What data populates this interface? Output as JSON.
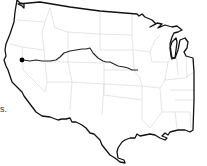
{
  "map": {
    "region": "Contiguous United States (western and central portion)",
    "colors": {
      "background": "#ffffff",
      "coastline": "#111111",
      "state_borders": "#d4d4d4",
      "route": "#222222",
      "marker": "#000000"
    },
    "route": {
      "description": "Route line from a point in northern California/Nevada eastward to the Kansas/Missouri area",
      "start_marker": "dot"
    }
  },
  "caption_fragment": "s."
}
